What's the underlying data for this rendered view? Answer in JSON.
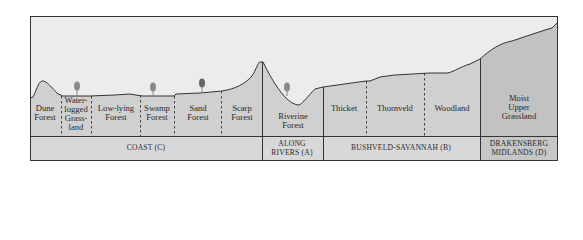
{
  "colors": {
    "sky": "#ececec",
    "ground": "#d0d0d0",
    "ground_dark": "#c2c2c2",
    "band": "#d8d8d8",
    "band_dark": "#c6c6c6",
    "line": "#333333",
    "tree": "#8a8a8a"
  },
  "vegetation_types": [
    {
      "id": "dune-forest",
      "label": "Dune\nForest",
      "x": 45,
      "y": 104
    },
    {
      "id": "waterlogged-grassland",
      "label": "Water-\nlogged\nGrass-\nland",
      "x": 76,
      "y": 97
    },
    {
      "id": "low-lying-forest",
      "label": "Low-lying\nForest",
      "x": 116,
      "y": 104
    },
    {
      "id": "swamp-forest",
      "label": "Swamp\nForest",
      "x": 157,
      "y": 104
    },
    {
      "id": "sand-forest",
      "label": "Sand\nForest",
      "x": 198,
      "y": 104
    },
    {
      "id": "scarp-forest",
      "label": "Scarp\nForest",
      "x": 242,
      "y": 104
    },
    {
      "id": "riverine-forest",
      "label": "Riverine\nForest",
      "x": 293,
      "y": 112
    },
    {
      "id": "thicket",
      "label": "Thicket",
      "x": 344,
      "y": 104
    },
    {
      "id": "thornveld",
      "label": "Thornveld",
      "x": 395,
      "y": 104
    },
    {
      "id": "woodland",
      "label": "Woodland",
      "x": 452,
      "y": 104
    },
    {
      "id": "moist-upper-grassland",
      "label": "Moist\nUpper\nGrassland",
      "x": 519,
      "y": 94
    }
  ],
  "regions": [
    {
      "id": "coast",
      "label": "COAST (C)",
      "x": 146,
      "y": 140
    },
    {
      "id": "along-rivers",
      "label": "ALONG\nRIVERS (A)",
      "x": 292,
      "y": 140
    },
    {
      "id": "bushveld-savannah",
      "label": "BUSHVELD-SAVANNAH (B)",
      "x": 401,
      "y": 140
    },
    {
      "id": "drakensberg-midlands",
      "label": "DRAKENSBERG\nMIDLANDS (D)",
      "x": 519,
      "y": 140
    }
  ],
  "trees": [
    {
      "x": 77,
      "y": 96
    },
    {
      "x": 153,
      "y": 97
    },
    {
      "x": 202,
      "y": 95
    },
    {
      "x": 287,
      "y": 95
    }
  ]
}
